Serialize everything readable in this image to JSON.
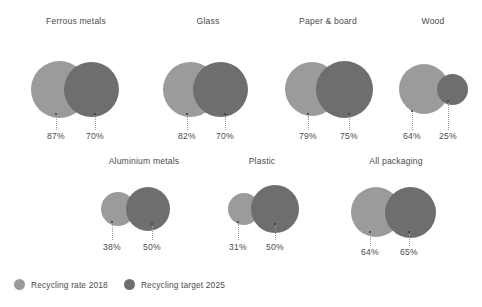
{
  "chart_data": {
    "type": "bubble",
    "title": "",
    "subtitle": "",
    "xlabel": "",
    "ylabel": "",
    "unit": "%",
    "grid": false,
    "legend_position": "bottom-left",
    "colors": {
      "rate_2018": "#9b9b9b",
      "target_2025": "#6e6e6e",
      "text": "#4b4b4b",
      "leader_line": "#9a9a9a",
      "background": "#ffffff"
    },
    "series": [
      {
        "name": "Recycling rate 2018",
        "key": "rate_2018",
        "values": [
          87,
          82,
          79,
          64,
          38,
          31,
          64
        ]
      },
      {
        "name": "Recycling target 2025",
        "key": "target_2025",
        "values": [
          70,
          70,
          75,
          25,
          50,
          50,
          65
        ]
      }
    ],
    "categories": [
      "Ferrous metals",
      "Glass",
      "Paper & board",
      "Wood",
      "Aluminium metals",
      "Plastic",
      "All packaging"
    ],
    "groups": [
      {
        "title": "Ferrous metals",
        "left": 12,
        "top": 14,
        "width": 128,
        "height": 126,
        "title_top": 2,
        "title_center_x": 64,
        "circles": [
          {
            "series": "rate_2018",
            "value_label": "87%",
            "cx": 47.5,
            "cy": 75,
            "r": 28.5,
            "z": 1,
            "dot_y": 100,
            "leader_x": 44,
            "leader_y1": 102,
            "leader_h": 14,
            "label_x": 44,
            "label_y": 117
          },
          {
            "series": "target_2025",
            "value_label": "70%",
            "cx": 79,
            "cy": 75,
            "r": 27.5,
            "z": 2,
            "dot_y": 100,
            "leader_x": 83,
            "leader_y1": 102,
            "leader_h": 14,
            "label_x": 83,
            "label_y": 117
          }
        ]
      },
      {
        "title": "Glass",
        "left": 148,
        "top": 14,
        "width": 120,
        "height": 126,
        "title_top": 2,
        "title_center_x": 60,
        "circles": [
          {
            "series": "rate_2018",
            "value_label": "82%",
            "cx": 42,
            "cy": 75,
            "r": 27.5,
            "z": 1,
            "dot_y": 100,
            "leader_x": 39,
            "leader_y1": 102,
            "leader_h": 14,
            "label_x": 39,
            "label_y": 117
          },
          {
            "series": "target_2025",
            "value_label": "70%",
            "cx": 72,
            "cy": 75,
            "r": 27.5,
            "z": 2,
            "dot_y": 100,
            "leader_x": 77,
            "leader_y1": 102,
            "leader_h": 14,
            "label_x": 77,
            "label_y": 117
          }
        ]
      },
      {
        "title": "Paper & board",
        "left": 272,
        "top": 14,
        "width": 124,
        "height": 126,
        "title_top": 2,
        "title_center_x": 56,
        "circles": [
          {
            "series": "rate_2018",
            "value_label": "79%",
            "cx": 40,
            "cy": 75,
            "r": 27,
            "z": 1,
            "dot_y": 100,
            "leader_x": 36,
            "leader_y1": 102,
            "leader_h": 14,
            "label_x": 36,
            "label_y": 117
          },
          {
            "series": "target_2025",
            "value_label": "75%",
            "cx": 72,
            "cy": 75,
            "r": 28.5,
            "z": 2,
            "dot_y": 100,
            "leader_x": 77,
            "leader_y1": 102,
            "leader_h": 14,
            "label_x": 77,
            "label_y": 117
          }
        ]
      },
      {
        "title": "Wood",
        "left": 390,
        "top": 14,
        "width": 92,
        "height": 126,
        "title_top": 2,
        "title_center_x": 43,
        "circles": [
          {
            "series": "rate_2018",
            "value_label": "64%",
            "cx": 34,
            "cy": 75,
            "r": 25,
            "z": 1,
            "dot_y": 97,
            "leader_x": 22,
            "leader_y1": 99,
            "leader_h": 17,
            "label_x": 22,
            "label_y": 117
          },
          {
            "series": "target_2025",
            "value_label": "25%",
            "cx": 62,
            "cy": 75,
            "r": 15.5,
            "z": 2,
            "dot_y": 87,
            "leader_x": 58,
            "leader_y1": 89,
            "leader_h": 27,
            "label_x": 58,
            "label_y": 117
          }
        ]
      },
      {
        "title": "Aluminium metals",
        "left": 82,
        "top": 154,
        "width": 124,
        "height": 118,
        "title_top": 2,
        "title_center_x": 62,
        "circles": [
          {
            "series": "rate_2018",
            "value_label": "38%",
            "cx": 36,
            "cy": 55,
            "r": 17,
            "z": 1,
            "dot_y": 68,
            "leader_x": 30,
            "leader_y1": 70,
            "leader_h": 16,
            "label_x": 30,
            "label_y": 88
          },
          {
            "series": "target_2025",
            "value_label": "50%",
            "cx": 66,
            "cy": 55,
            "r": 22,
            "z": 2,
            "dot_y": 70,
            "leader_x": 70,
            "leader_y1": 72,
            "leader_h": 14,
            "label_x": 70,
            "label_y": 88
          }
        ]
      },
      {
        "title": "Plastic",
        "left": 212,
        "top": 154,
        "width": 110,
        "height": 118,
        "title_top": 2,
        "title_center_x": 50,
        "circles": [
          {
            "series": "rate_2018",
            "value_label": "31%",
            "cx": 32,
            "cy": 55,
            "r": 16,
            "z": 1,
            "dot_y": 68,
            "leader_x": 26,
            "leader_y1": 70,
            "leader_h": 16,
            "label_x": 26,
            "label_y": 88
          },
          {
            "series": "target_2025",
            "value_label": "50%",
            "cx": 63,
            "cy": 55,
            "r": 24,
            "z": 2,
            "dot_y": 70,
            "leader_x": 63,
            "leader_y1": 72,
            "leader_h": 14,
            "label_x": 63,
            "label_y": 88
          }
        ]
      },
      {
        "title": "All packaging",
        "left": 334,
        "top": 154,
        "width": 126,
        "height": 118,
        "title_top": 2,
        "title_center_x": 62,
        "circles": [
          {
            "series": "rate_2018",
            "value_label": "64%",
            "cx": 42,
            "cy": 58,
            "r": 25,
            "z": 1,
            "dot_y": 78,
            "leader_x": 36,
            "leader_y1": 80,
            "leader_h": 12,
            "label_x": 36,
            "label_y": 93
          },
          {
            "series": "target_2025",
            "value_label": "65%",
            "cx": 76,
            "cy": 58,
            "r": 25.5,
            "z": 2,
            "dot_y": 78,
            "leader_x": 75,
            "leader_y1": 80,
            "leader_h": 12,
            "label_x": 75,
            "label_y": 93
          }
        ]
      }
    ],
    "legend": [
      {
        "label": "Recycling rate 2018",
        "color": "#9b9b9b",
        "icon": "circle-swatch-icon"
      },
      {
        "label": "Recycling target 2025",
        "color": "#6e6e6e",
        "icon": "circle-swatch-icon"
      }
    ]
  }
}
